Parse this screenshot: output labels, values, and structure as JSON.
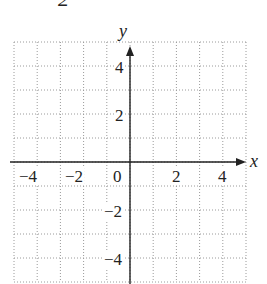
{
  "figure": {
    "cropped_top_label": "2",
    "axes": {
      "x_label": "x",
      "y_label": "y",
      "xlim": [
        -5,
        5
      ],
      "ylim": [
        -5,
        5
      ],
      "grid": true,
      "grid_step": 1
    },
    "x_ticks": [
      {
        "value": -4,
        "label": "−4"
      },
      {
        "value": -2,
        "label": "−2"
      },
      {
        "value": 0,
        "label": "0"
      },
      {
        "value": 2,
        "label": "2"
      },
      {
        "value": 4,
        "label": "4"
      }
    ],
    "y_ticks": [
      {
        "value": 4,
        "label": "4"
      },
      {
        "value": 2,
        "label": "2"
      },
      {
        "value": -2,
        "label": "−2"
      },
      {
        "value": -4,
        "label": "−4"
      }
    ],
    "colors": {
      "axis": "#222222",
      "grid": "#9a9a9a"
    }
  }
}
